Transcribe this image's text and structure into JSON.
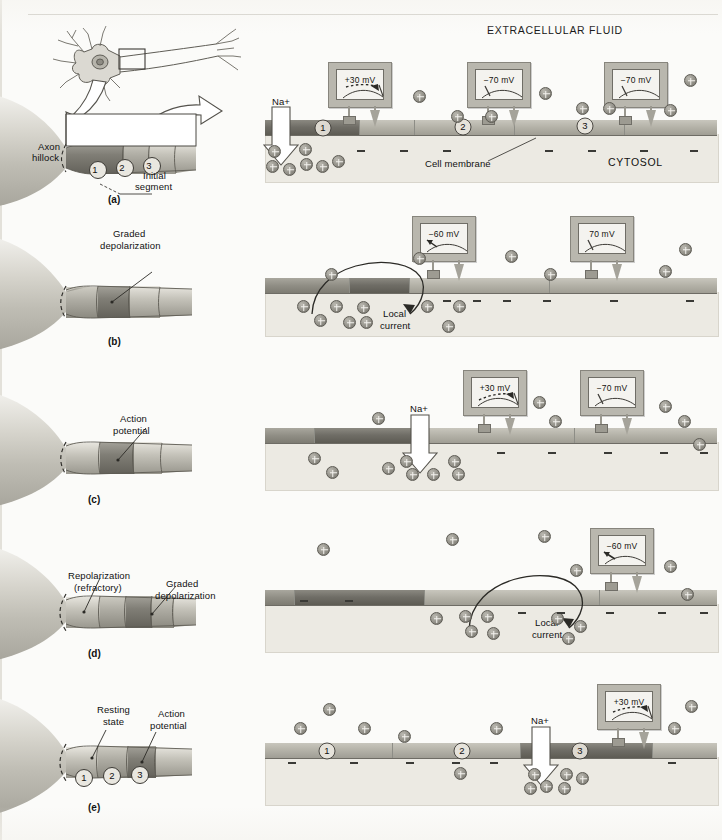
{
  "figure": {
    "title_labels": {
      "extracellular_fluid": "EXTRACELLULAR FLUID",
      "cytosol": "CYTOSOL",
      "cell_membrane": "Cell membrane"
    },
    "ion_label": "Na+",
    "local_current_label": "Local\ncurrent",
    "local_current_line1": "Local",
    "local_current_line2": "current"
  },
  "panels": [
    {
      "letter": "(a)",
      "left_labels": [
        "Axon",
        "hillock",
        "Initial",
        "segment"
      ],
      "axon_label_line1": "Axon",
      "axon_label_line2": "hillock",
      "initial_line1": "Initial",
      "initial_line2": "segment",
      "segment_numbers": [
        "1",
        "2",
        "3"
      ],
      "meters": [
        "+30 mV",
        "−70 mV",
        "−70 mV"
      ],
      "strip_numbers": [
        "1",
        "2",
        "3"
      ],
      "na_label": "Na+"
    },
    {
      "letter": "(b)",
      "label_line1": "Graded",
      "label_line2": "depolarization",
      "meters": [
        "−60 mV",
        "70 mV"
      ],
      "local_current": true
    },
    {
      "letter": "(c)",
      "label_line1": "Action",
      "label_line2": "potential",
      "meters": [
        "+30 mV",
        "−70 mV"
      ],
      "na_label": "Na+"
    },
    {
      "letter": "(d)",
      "label_a_line1": "Repolarization",
      "label_a_line2": "(refractory)",
      "label_b_line1": "Graded",
      "label_b_line2": "depolarization",
      "meters": [
        "−60 mV"
      ],
      "local_current": true
    },
    {
      "letter": "(e)",
      "label_a_line1": "Resting",
      "label_a_line2": "state",
      "label_b_line1": "Action",
      "label_b_line2": "potential",
      "segment_numbers": [
        "1",
        "2",
        "3"
      ],
      "strip_numbers": [
        "1",
        "2",
        "3"
      ],
      "meters": [
        "+30 mV"
      ],
      "na_label": "Na+"
    }
  ],
  "colors": {
    "membrane_resting": "#b4b2a8",
    "membrane_active": "#6f6d66",
    "cytosol": "#eceae3",
    "ion": "#8e8c84",
    "meter_body": "#b9b7ae",
    "ink": "#1b1b1b"
  }
}
